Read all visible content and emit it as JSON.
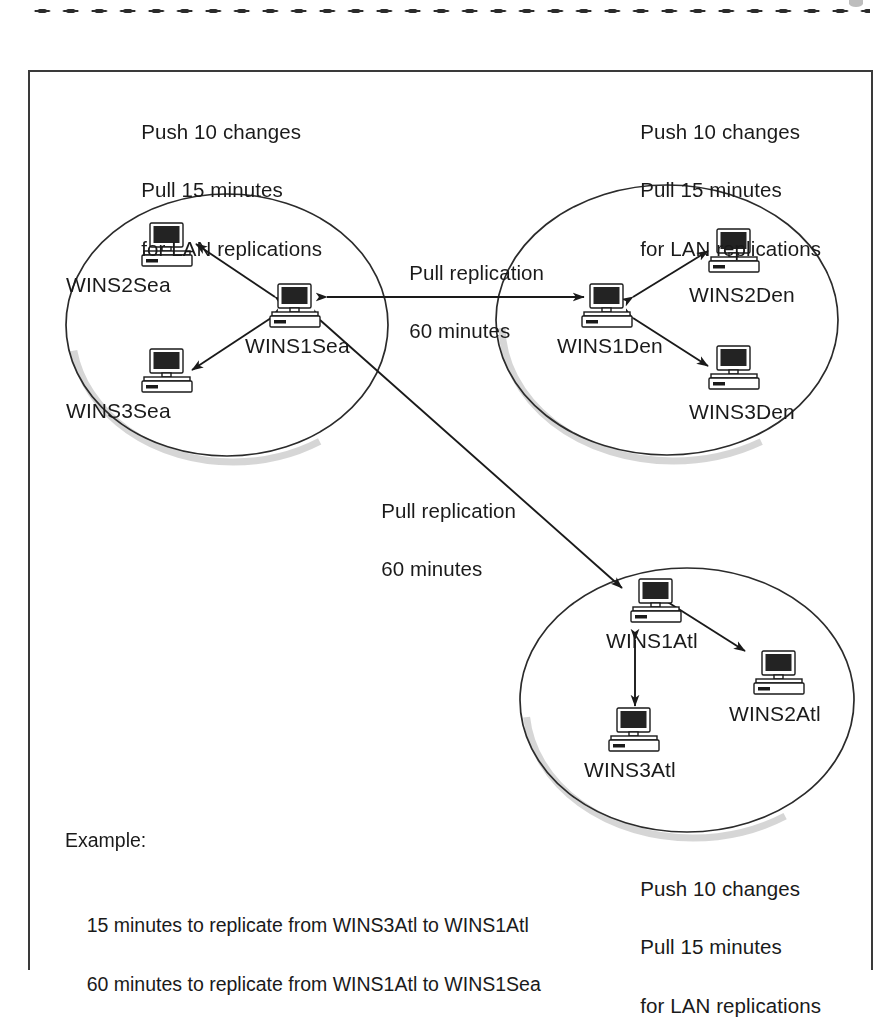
{
  "figure": {
    "type": "wins-replication-topology-diagram",
    "border_color": "#3a3a3a",
    "shadow_color": "#b8b8b8",
    "ink_color": "#1a1a1a"
  },
  "notes": {
    "seattle_policy": {
      "line1": "Push 10 changes",
      "line2": "Pull 15 minutes",
      "line3": "for LAN replications"
    },
    "denver_policy": {
      "line1": "Push 10 changes",
      "line2": "Pull 15 minutes",
      "line3": "for LAN replications"
    },
    "atlanta_policy": {
      "line1": "Push 10 changes",
      "line2": "Pull 15 minutes",
      "line3": "for LAN replications"
    }
  },
  "wan_links": [
    {
      "id": "sea-den",
      "line1": "Pull replication",
      "line2": "60 minutes"
    },
    {
      "id": "sea-atl",
      "line1": "Pull replication",
      "line2": "60 minutes"
    }
  ],
  "clusters": [
    {
      "id": "seattle",
      "hub": "WINS1Sea",
      "nodes": [
        {
          "name": "WINS2Sea",
          "role": "spoke"
        },
        {
          "name": "WINS1Sea",
          "role": "hub"
        },
        {
          "name": "WINS3Sea",
          "role": "spoke"
        }
      ]
    },
    {
      "id": "denver",
      "hub": "WINS1Den",
      "nodes": [
        {
          "name": "WINS2Den",
          "role": "spoke"
        },
        {
          "name": "WINS1Den",
          "role": "hub"
        },
        {
          "name": "WINS3Den",
          "role": "spoke"
        }
      ]
    },
    {
      "id": "atlanta",
      "hub": "WINS1Atl",
      "nodes": [
        {
          "name": "WINS1Atl",
          "role": "hub"
        },
        {
          "name": "WINS2Atl",
          "role": "spoke"
        },
        {
          "name": "WINS3Atl",
          "role": "spoke"
        }
      ]
    }
  ],
  "example": {
    "heading": "Example:",
    "line1": "15 minutes to replicate from WINS3Atl to WINS1Atl",
    "line2": "60 minutes to replicate from WINS1Atl to WINS1Sea"
  }
}
